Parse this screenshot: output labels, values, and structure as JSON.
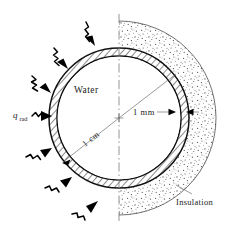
{
  "figure": {
    "background_color": "#ffffff",
    "line_color": "#111111"
  },
  "labels": {
    "water": "Water",
    "insulation": "Insulation",
    "inner_diameter": "1 cm",
    "wall_thickness": "1 mm",
    "radiation_symbol": "q",
    "radiation_subscript": "rad"
  },
  "geometry": {
    "center_x": 119,
    "center_y": 118,
    "inner_radius": 62,
    "outer_radius": 70,
    "insulation_outer_radius": 97,
    "radiation_arrow_count": 6
  },
  "icons": {
    "radiation_arrow": "wavy-arrow-icon",
    "centerline": "axis-centerline-icon",
    "dimension_arrow": "dimension-arrow-icon",
    "leader_line": "leader-line-icon"
  },
  "colors": {
    "outline": "#111111",
    "hatch": "#222222",
    "stipple": "#4a4a4a",
    "centerline": "#888888",
    "dimension": "#555555"
  }
}
